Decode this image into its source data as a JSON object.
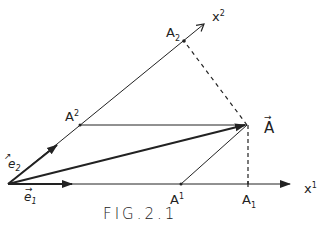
{
  "figure": {
    "caption": "FIG.2.1",
    "stroke_color": "#222222",
    "background": "#ffffff"
  },
  "axes": {
    "x1": {
      "base": "x",
      "index": "1"
    },
    "x2": {
      "base": "x",
      "index": "2"
    }
  },
  "basis_vectors": {
    "e1": {
      "base": "e",
      "index": "1",
      "arrow": "→"
    },
    "e2": {
      "base": "e",
      "index": "2",
      "arrow": "↗"
    }
  },
  "points": {
    "A_vector": {
      "base": "A",
      "arrow": "→"
    },
    "A_upper_2": {
      "base": "A",
      "index": "2"
    },
    "A_upper_1": {
      "base": "A",
      "index": "1"
    },
    "A_lower_1": {
      "base": "A",
      "index": "1"
    },
    "A_lower_2": {
      "base": "A",
      "index": "2"
    }
  }
}
